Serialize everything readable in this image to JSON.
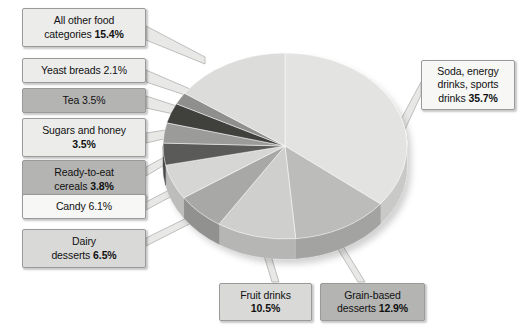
{
  "chart_data": {
    "type": "pie",
    "title": "",
    "subtitle": "",
    "xlabel": "",
    "ylabel": "",
    "legend_position": "callout-labels",
    "grid": false,
    "start_angle_deg": 0,
    "direction": "clockwise",
    "units": "percent",
    "categories": [
      "Soda, energy drinks, sports drinks",
      "Grain-based desserts",
      "Fruit drinks",
      "Dairy desserts",
      "Candy",
      "Ready-to-eat cereals",
      "Sugars and honey",
      "Tea",
      "Yeast breads",
      "All other food categories"
    ],
    "values": [
      35.7,
      12.9,
      10.5,
      6.5,
      6.1,
      3.8,
      3.5,
      3.5,
      2.1,
      15.4
    ],
    "slice_colors": [
      "#e3e3e2",
      "#bcbcbb",
      "#cfcfce",
      "#a8a8a7",
      "#d6d6d5",
      "#5a5a59",
      "#9b9b9a",
      "#3f3f3e",
      "#8f8f8e",
      "#dcdcdb"
    ],
    "side_colors": [
      "#c9c9c8",
      "#a3a3a2",
      "#b6b6b5",
      "#919190",
      "#bdbdbc",
      "#4a4a49",
      "#868685",
      "#333332",
      "#7b7b7a",
      "#c3c3c2"
    ]
  },
  "callouts": [
    {
      "id": "all-other-food-categories",
      "label": "All other food",
      "label2": "categories",
      "value": "15.4%",
      "fill": "fill-light",
      "lines": [
        "All other food",
        "categories 15.4%"
      ]
    },
    {
      "id": "yeast-breads",
      "label": "Yeast breads",
      "value": "2.1%",
      "fill": "fill-light",
      "lines": [
        "Yeast breads 2.1%"
      ]
    },
    {
      "id": "tea",
      "label": "Tea",
      "value": "3.5%",
      "fill": "fill-dark",
      "lines": [
        "Tea 3.5%"
      ]
    },
    {
      "id": "sugars-and-honey",
      "label": "Sugars and honey",
      "value": "3.5%",
      "fill": "fill-light",
      "lines": [
        "Sugars and honey",
        "3.5%"
      ]
    },
    {
      "id": "ready-to-eat-cereals",
      "label": "Ready-to-eat",
      "label2": "cereals",
      "value": "3.8%",
      "fill": "fill-dark",
      "lines": [
        "Ready-to-eat",
        "cereals 3.8%"
      ]
    },
    {
      "id": "candy",
      "label": "Candy",
      "value": "6.1%",
      "fill": "fill-white",
      "lines": [
        "Candy 6.1%"
      ]
    },
    {
      "id": "dairy-desserts",
      "label": "Dairy",
      "label2": "desserts",
      "value": "6.5%",
      "fill": "fill-mid",
      "lines": [
        "Dairy",
        "desserts 6.5%"
      ]
    },
    {
      "id": "fruit-drinks",
      "label": "Fruit drinks",
      "value": "10.5%",
      "fill": "fill-mid",
      "lines": [
        "Fruit drinks",
        "10.5%"
      ]
    },
    {
      "id": "grain-based-desserts",
      "label": "Grain-based",
      "label2": "desserts",
      "value": "12.9%",
      "fill": "fill-dark",
      "lines": [
        "Grain-based",
        "desserts 12.9%"
      ]
    },
    {
      "id": "soda-energy-drinks-sports-drinks",
      "label": "Soda, energy drinks, sports drinks",
      "value": "35.7%",
      "fill": "fill-white",
      "lines": [
        "Soda, energy",
        "drinks, sports",
        "drinks 35.7%"
      ]
    }
  ],
  "colors": {
    "background": "#ffffff",
    "box_border": "#9a9a9a",
    "text": "#111111",
    "leader_line": "#b0b0b0"
  }
}
